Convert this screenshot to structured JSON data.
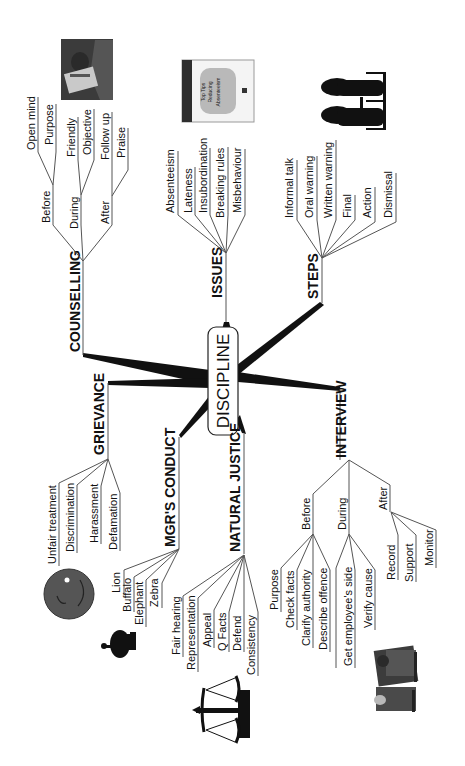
{
  "title": "DISCIPLINE",
  "orientation": "rotated-90-ccw",
  "colors": {
    "ink": "#111111",
    "line": "#555555",
    "background": "#ffffff"
  },
  "branches": {
    "counselling": {
      "label": "COUNSELLING",
      "image": "counselling-session-picture",
      "children": [
        {
          "label": "Before",
          "children": [
            "Open mind",
            "Purpose"
          ]
        },
        {
          "label": "During",
          "children": [
            "Friendly",
            "Objective"
          ]
        },
        {
          "label": "After",
          "children": [
            "Follow up",
            "Praise"
          ]
        }
      ]
    },
    "issues": {
      "label": "ISSUES",
      "image": "book-cover-top-tips-reducing-absenteeism",
      "book_text": [
        "Top Tips",
        "for",
        "Reducing",
        "Absenteeism"
      ],
      "children": [
        "Absenteeism",
        "Lateness",
        "Insubordination",
        "Breaking rules",
        "Misbehaviour"
      ]
    },
    "steps": {
      "label": "STEPS",
      "image": "two-people-meeting-silhouette",
      "children": [
        "Informal talk",
        "Oral warning",
        "Written warning",
        "Final",
        "Action",
        "Dismissal"
      ]
    },
    "grievance": {
      "label": "GRIEVANCE",
      "image": "sad-face",
      "children": [
        "Unfair treatment",
        "Discrimination",
        "Harassment",
        "Defamation"
      ]
    },
    "mgrs_conduct": {
      "label": "MGR'S CONDUCT",
      "image": "animal-silhouette",
      "children": [
        "Lion",
        "Buffalo",
        "Elephant",
        "Zebra"
      ]
    },
    "natural_justice": {
      "label": "NATURAL JUSTICE",
      "image": "scales-of-justice",
      "children": [
        "Fair hearing",
        "Representation",
        "Appeal",
        "Q Facts",
        "Defend",
        "Consistency"
      ]
    },
    "interview": {
      "label": "INTERVIEW",
      "image": "interview-at-desk-picture",
      "children": [
        {
          "label": "Before",
          "children": [
            "Purpose",
            "Check facts",
            "Clarify authority",
            "Describe offence"
          ]
        },
        {
          "label": "During",
          "children": [
            "Get employee's side",
            "Verify cause"
          ]
        },
        {
          "label": "After",
          "children": [
            "Record",
            "Support",
            "Monitor"
          ]
        }
      ]
    }
  }
}
